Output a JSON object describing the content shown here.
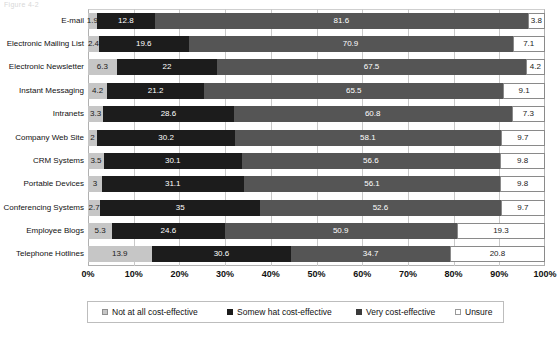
{
  "chart": {
    "title": "Figure 4-2",
    "axis": {
      "xlabel": "",
      "ylabel": ""
    }
  },
  "legend": {
    "items": [
      {
        "label": "Not at all cost-effective",
        "swatch": "notatall",
        "color": "#c6c6c6"
      },
      {
        "label": "Somew hat cost-effective",
        "swatch": "somewhat",
        "color": "#1c1c1c"
      },
      {
        "label": "Very cost-effective",
        "swatch": "very",
        "color": "#555555"
      },
      {
        "label": "Unsure",
        "swatch": "unsure",
        "color": "#ffffff"
      }
    ]
  },
  "chart_data": {
    "type": "bar",
    "orientation": "horizontal",
    "stacked": true,
    "stack_mode": "percent",
    "title": "Figure 4-2",
    "xlabel": "",
    "ylabel": "",
    "xlim": [
      0,
      100
    ],
    "xticks": [
      "0%",
      "10%",
      "20%",
      "30%",
      "40%",
      "50%",
      "60%",
      "70%",
      "80%",
      "90%",
      "100%"
    ],
    "xtick_values": [
      0,
      10,
      20,
      30,
      40,
      50,
      60,
      70,
      80,
      90,
      100
    ],
    "grid": true,
    "legend_position": "bottom",
    "categories": [
      "E-mail",
      "Electronic Mailing List",
      "Electronic Newsletter",
      "Instant Messaging",
      "Intranets",
      "Company Web Site",
      "CRM Systems",
      "Portable Devices",
      "Conferencing Systems",
      "Employee Blogs",
      "Telephone Hotlines"
    ],
    "series": [
      {
        "name": "Not at all cost-effective",
        "color": "#c6c6c6",
        "values": [
          1.9,
          2.4,
          6.3,
          4.2,
          3.3,
          2,
          3.5,
          3,
          2.7,
          5.3,
          13.9
        ]
      },
      {
        "name": "Somew hat cost-effective",
        "color": "#1c1c1c",
        "values": [
          12.8,
          19.6,
          22,
          21.2,
          28.6,
          30.2,
          30.1,
          31.1,
          35,
          24.6,
          30.6
        ]
      },
      {
        "name": "Very cost-effective",
        "color": "#555555",
        "values": [
          81.6,
          70.9,
          67.5,
          65.5,
          60.8,
          58.1,
          56.6,
          56.1,
          52.6,
          50.9,
          34.7
        ]
      },
      {
        "name": "Unsure",
        "color": "#ffffff",
        "values": [
          3.8,
          7.1,
          4.2,
          9.1,
          7.3,
          9.7,
          9.8,
          9.8,
          9.7,
          19.3,
          20.8
        ]
      }
    ]
  }
}
